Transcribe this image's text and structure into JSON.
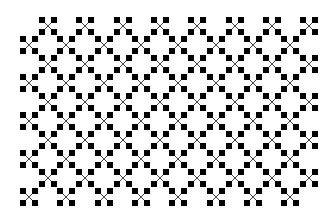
{
  "pattern": {
    "name": "cross-stitch-diamond-lattice",
    "background": "#ffffff",
    "foreground": "#000000",
    "line_color": "#444444",
    "period_x": 37.3,
    "period_y": 38,
    "square_size": 6,
    "arm_offset": 6,
    "grids": [
      {
        "origin_x": 48,
        "origin_y": 26,
        "cols": 8,
        "rows": 5
      },
      {
        "origin_x": 29,
        "origin_y": 45,
        "cols": 8,
        "rows": 5
      }
    ]
  }
}
